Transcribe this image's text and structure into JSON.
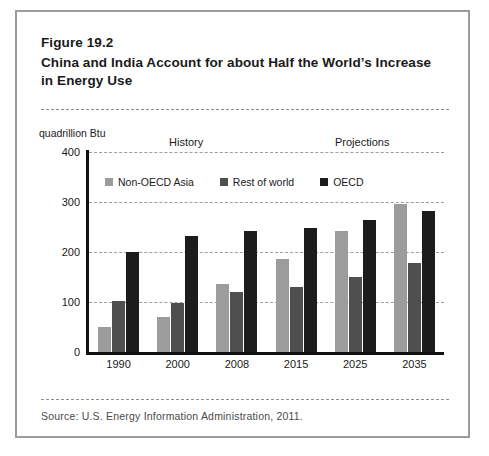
{
  "figure": {
    "number": "Figure 19.2",
    "title": "China and India Account for about Half the World’s Increase in Energy Use",
    "source": "Source: U.S. Energy Information Administration, 2011."
  },
  "chart_data": {
    "type": "bar",
    "title": "China and India Account for about Half the World’s Increase in Energy Use",
    "xlabel": "",
    "ylabel": "quadrillion Btu",
    "ylim": [
      0,
      400
    ],
    "yticks": [
      0,
      100,
      200,
      300,
      400
    ],
    "grid": true,
    "legend_position": "top-inside",
    "categories": [
      "1990",
      "2000",
      "2008",
      "2015",
      "2025",
      "2035"
    ],
    "series": [
      {
        "name": "Non-OECD Asia",
        "color": "#9c9c9c",
        "values": [
          50,
          70,
          136,
          187,
          243,
          297
        ]
      },
      {
        "name": "Rest of world",
        "color": "#4f4f4f",
        "values": [
          103,
          98,
          120,
          131,
          150,
          178
        ]
      },
      {
        "name": "OECD",
        "color": "#1c1c1c",
        "values": [
          200,
          232,
          242,
          248,
          265,
          283
        ]
      }
    ],
    "annotations": [
      {
        "text": "History",
        "position": "left"
      },
      {
        "text": "Projections",
        "position": "right"
      }
    ]
  }
}
